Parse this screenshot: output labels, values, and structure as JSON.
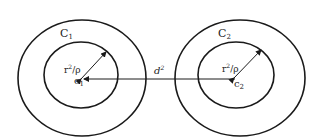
{
  "diagram": {
    "type": "two-concentric-circle-pairs",
    "left": {
      "outer_label": "C",
      "outer_label_sub": "1",
      "center_label": "c",
      "center_label_sub": "1",
      "radius_label_base": "r",
      "radius_label_sup": "2",
      "radius_label_rest": "/ρ"
    },
    "right": {
      "outer_label": "C",
      "outer_label_sub": "2",
      "center_label": "c",
      "center_label_sub": "2",
      "radius_label_base": "r",
      "radius_label_sup": "2",
      "radius_label_rest": "/ρ"
    },
    "distance_label_base": "d",
    "distance_label_sup": "2",
    "stroke_color": "#1a1a1a"
  }
}
